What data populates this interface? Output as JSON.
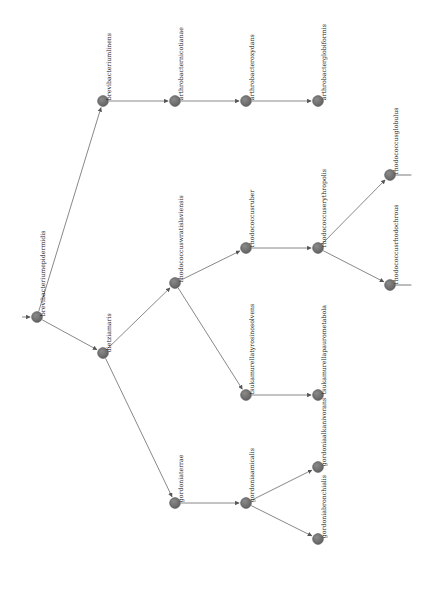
{
  "diagram": {
    "type": "phylogenetic-tree",
    "title": "",
    "width": 433,
    "height": 589,
    "background_color": "#ffffff",
    "node_color": "#6b6b6b",
    "node_stroke_color": "#555555",
    "edge_color": "#7a7a7a",
    "label_color": "#1a1a1a",
    "node_radius": 5.4,
    "label_rotation_deg": -90,
    "root_id": "brevibacteriumepidermidis",
    "nodes": [
      {
        "id": "brevibacteriumepidermidis",
        "label": "brevibacteriumepidermidis",
        "x": 37,
        "y": 317,
        "label_offset_x": 9,
        "label_offset_y": -7,
        "stub": false
      },
      {
        "id": "brevibacteriumlinens",
        "label": "brevibacteriumlinens",
        "x": 103,
        "y": 101,
        "label_offset_x": 9,
        "label_offset_y": -7,
        "stub": false
      },
      {
        "id": "arthrobacternicotianae",
        "label": "arthrobacternicotianae",
        "x": 175,
        "y": 101,
        "label_offset_x": 9,
        "label_offset_y": -7,
        "stub": false
      },
      {
        "id": "arthrobacteroxydans",
        "label": "arthrobacteroxydans",
        "x": 246,
        "y": 101,
        "label_offset_x": 9,
        "label_offset_y": -7,
        "stub": false
      },
      {
        "id": "arthrobacterglobiformis",
        "label": "arthrobacterglobiformis",
        "x": 318,
        "y": 101,
        "label_offset_x": 9,
        "label_offset_y": -7,
        "stub": false
      },
      {
        "id": "dietziamaris",
        "label": "dietziamaris",
        "x": 103,
        "y": 353,
        "label_offset_x": 9,
        "label_offset_y": -7,
        "stub": false
      },
      {
        "id": "rhodococcuswratislaviensis",
        "label": "rhodococcuswratislaviensis",
        "x": 175,
        "y": 283,
        "label_offset_x": 9,
        "label_offset_y": -7,
        "stub": false
      },
      {
        "id": "rhodococcusruber",
        "label": "rhodococcusruber",
        "x": 246,
        "y": 248,
        "label_offset_x": 9,
        "label_offset_y": -7,
        "stub": false
      },
      {
        "id": "rhodococcuserythropolis",
        "label": "rhodococcuserythropolis",
        "x": 318,
        "y": 248,
        "label_offset_x": 9,
        "label_offset_y": -7,
        "stub": false
      },
      {
        "id": "rhodococcusglobulus",
        "label": "rhodococcusglobulus",
        "x": 390,
        "y": 175,
        "label_offset_x": 9,
        "label_offset_y": -7,
        "stub": true
      },
      {
        "id": "rhodococcusrhodochrous",
        "label": "rhodococcusrhodochrous",
        "x": 390,
        "y": 285,
        "label_offset_x": 9,
        "label_offset_y": -7,
        "stub": true
      },
      {
        "id": "tsukamurellatyrosinosolvens",
        "label": "tsukamurellatyrosinosolvens",
        "x": 246,
        "y": 395,
        "label_offset_x": 9,
        "label_offset_y": -7,
        "stub": false
      },
      {
        "id": "tsukamurellapaurometabola",
        "label": "tsukamurellapaurometabola",
        "x": 318,
        "y": 395,
        "label_offset_x": 9,
        "label_offset_y": -7,
        "stub": false
      },
      {
        "id": "gordoniaterrae",
        "label": "gordoniaterrae",
        "x": 175,
        "y": 503,
        "label_offset_x": 9,
        "label_offset_y": -7,
        "stub": false
      },
      {
        "id": "gordoniaamicalis",
        "label": "gordoniaamicalis",
        "x": 246,
        "y": 503,
        "label_offset_x": 9,
        "label_offset_y": -7,
        "stub": false
      },
      {
        "id": "gordoniaalkanivorans",
        "label": "gordoniaalkanivorans",
        "x": 318,
        "y": 467,
        "label_offset_x": 9,
        "label_offset_y": -7,
        "stub": false
      },
      {
        "id": "gordoniabronchialis",
        "label": "gordoniabronchialis",
        "x": 318,
        "y": 539,
        "label_offset_x": 9,
        "label_offset_y": -7,
        "stub": false
      }
    ],
    "edges": [
      {
        "from": "brevibacteriumepidermidis",
        "to": "brevibacteriumlinens"
      },
      {
        "from": "brevibacteriumepidermidis",
        "to": "dietziamaris"
      },
      {
        "from": "brevibacteriumlinens",
        "to": "arthrobacternicotianae"
      },
      {
        "from": "arthrobacternicotianae",
        "to": "arthrobacteroxydans"
      },
      {
        "from": "arthrobacteroxydans",
        "to": "arthrobacterglobiformis"
      },
      {
        "from": "dietziamaris",
        "to": "rhodococcuswratislaviensis"
      },
      {
        "from": "dietziamaris",
        "to": "gordoniaterrae"
      },
      {
        "from": "rhodococcuswratislaviensis",
        "to": "rhodococcusruber"
      },
      {
        "from": "rhodococcuswratislaviensis",
        "to": "tsukamurellatyrosinosolvens"
      },
      {
        "from": "rhodococcusruber",
        "to": "rhodococcuserythropolis"
      },
      {
        "from": "rhodococcuserythropolis",
        "to": "rhodococcusglobulus"
      },
      {
        "from": "rhodococcuserythropolis",
        "to": "rhodococcusrhodochrous"
      },
      {
        "from": "tsukamurellatyrosinosolvens",
        "to": "tsukamurellapaurometabola"
      },
      {
        "from": "gordoniaterrae",
        "to": "gordoniaamicalis"
      },
      {
        "from": "gordoniaamicalis",
        "to": "gordoniaalkanivorans"
      },
      {
        "from": "gordoniaamicalis",
        "to": "gordoniabronchialis"
      }
    ],
    "root_inbound_marker": {
      "x": 22,
      "y": 317,
      "to_x": 37,
      "to_y": 317
    },
    "stub_length": 16
  }
}
